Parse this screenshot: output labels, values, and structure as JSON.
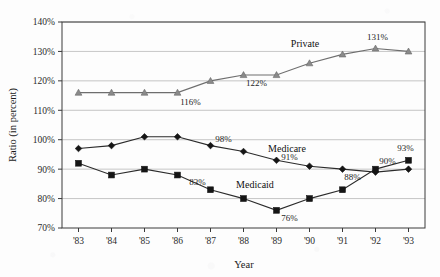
{
  "chart_data": {
    "type": "line",
    "title": "",
    "xlabel": "Year",
    "ylabel": "Ratio (in percent)",
    "categories": [
      "'83",
      "'84",
      "'85",
      "'86",
      "'87",
      "'88",
      "'89",
      "'90",
      "'91",
      "'92",
      "'93"
    ],
    "ylim": [
      70,
      140
    ],
    "ytick_labels": [
      "70%",
      "80%",
      "90%",
      "100%",
      "110%",
      "120%",
      "130%",
      "140%"
    ],
    "ytick_values": [
      70,
      80,
      90,
      100,
      110,
      120,
      130,
      140
    ],
    "grid": true,
    "legend_position": "inline-labels",
    "series": [
      {
        "name": "Private",
        "marker": "triangle",
        "values": [
          116,
          116,
          116,
          116,
          120,
          122,
          122,
          126,
          129,
          131,
          130
        ],
        "point_labels": {
          "3": "116%",
          "5": "122%",
          "9": "131%"
        },
        "label_text": "Private"
      },
      {
        "name": "Medicare",
        "marker": "diamond",
        "values": [
          97,
          98,
          101,
          101,
          98,
          96,
          93,
          91,
          90,
          89,
          90
        ],
        "point_labels": {
          "4": "98%",
          "6": "91%",
          "8": "88%"
        },
        "label_text": "Medicare"
      },
      {
        "name": "Medicaid",
        "marker": "square",
        "values": [
          92,
          88,
          90,
          88,
          83,
          80,
          76,
          80,
          83,
          90,
          93
        ],
        "point_labels": {
          "4": "83%",
          "6": "76%",
          "9": "90%",
          "10": "93%"
        },
        "label_text": "Medicaid"
      }
    ],
    "annotations": [
      {
        "text": "116%",
        "series": "Private",
        "x_index": 3
      },
      {
        "text": "122%",
        "series": "Private",
        "x_index": 5
      },
      {
        "text": "131%",
        "series": "Private",
        "x_index": 9
      },
      {
        "text": "98%",
        "series": "Medicare",
        "x_index": 4
      },
      {
        "text": "91%",
        "series": "Medicare",
        "x_index": 6
      },
      {
        "text": "88%",
        "series": "Medicare",
        "x_index": 8
      },
      {
        "text": "90%",
        "series": "Medicaid",
        "x_index": 2
      },
      {
        "text": "83%",
        "series": "Medicaid",
        "x_index": 4
      },
      {
        "text": "76%",
        "series": "Medicaid",
        "x_index": 6
      },
      {
        "text": "93%",
        "series": "Medicaid",
        "x_index": 10
      }
    ]
  },
  "colors": {
    "axis": "#3a3a3a",
    "grid": "#b8b8b8",
    "dark_series": "#2b2b2b",
    "light_series": "#6e6e6e",
    "background": "#fdfdfd"
  }
}
